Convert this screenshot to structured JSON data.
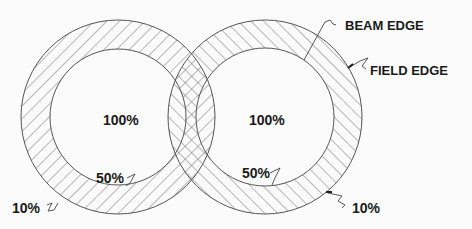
{
  "diagram": {
    "type": "overlapping-radiation-field-circles",
    "colors": {
      "background": "#fbfbfb",
      "line": "#555555",
      "text": "#1a1a1a"
    },
    "fields": [
      {
        "name": "left-field",
        "center_label": "100%",
        "inner_label": "50%",
        "outer_label": "10%",
        "hatch_direction": "forward-slash"
      },
      {
        "name": "right-field",
        "center_label": "100%",
        "inner_label": "50%",
        "outer_label": "10%",
        "hatch_direction": "back-slash"
      }
    ],
    "callouts": {
      "beam_edge": "BEAM EDGE",
      "field_edge": "FIELD EDGE"
    }
  }
}
